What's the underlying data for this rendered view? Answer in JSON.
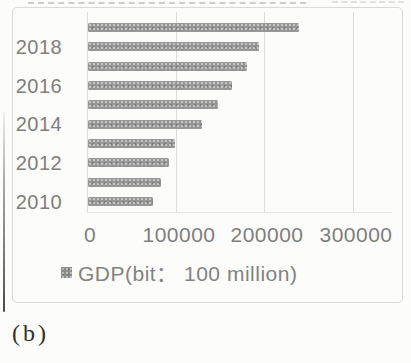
{
  "figure": {
    "panel_label": "(b)"
  },
  "chart_data": {
    "type": "bar",
    "orientation": "horizontal",
    "title": "",
    "categories": [
      "2019",
      "2018",
      "2017",
      "2016",
      "2015",
      "2014",
      "2013",
      "2012",
      "2011",
      "2010"
    ],
    "values": [
      238000,
      193000,
      179000,
      162000,
      146000,
      129000,
      98500,
      91000,
      82500,
      73000
    ],
    "series": [
      {
        "name": "GDP(bit： 100 million)",
        "values": [
          238000,
          193000,
          179000,
          162000,
          146000,
          129000,
          98500,
          91000,
          82500,
          73000
        ]
      }
    ],
    "ytick_labels": [
      "2018",
      "2016",
      "2014",
      "2012",
      "2010"
    ],
    "xticks": [
      0,
      100000,
      200000,
      300000
    ],
    "xtick_labels": [
      "0",
      "100000",
      "200000",
      "300000"
    ],
    "xlim": [
      0,
      340000
    ],
    "grid": "vertical-only",
    "legend": {
      "label": "GDP(bit： 100 million)",
      "position": "bottom"
    },
    "colors": {
      "bar": "#969696",
      "grid": "#dcdcdc",
      "axis_text": "#7e7e7e",
      "legend_text": "#828282",
      "frame_border": "#d9d9d6",
      "panel_label_text": "#2e2e2e"
    }
  }
}
